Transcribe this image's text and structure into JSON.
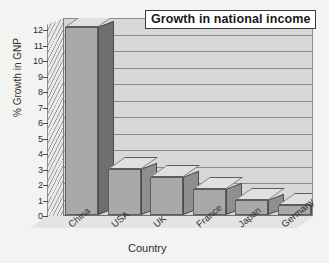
{
  "chart_data": {
    "type": "bar",
    "title": "Growth in national income",
    "xlabel": "Country",
    "ylabel": "% Growth in GNP",
    "categories": [
      "China",
      "USA",
      "UK",
      "France",
      "Japan",
      "Germany"
    ],
    "values": [
      11.4,
      2.8,
      2.3,
      1.6,
      0.9,
      0.6
    ],
    "ylim": [
      0,
      12
    ],
    "ytick_labels": [
      "0",
      "1",
      "2",
      "3",
      "4",
      "5",
      "6",
      "7",
      "8",
      "9",
      "10",
      "11",
      "12"
    ],
    "ytick_values": [
      0,
      1,
      2,
      3,
      4,
      5,
      6,
      7,
      8,
      9,
      10,
      11,
      12
    ],
    "grid": true,
    "legend": "none",
    "style": "3d-bar",
    "colors": {
      "bar_front": "#a9a9a9",
      "bar_side": "#6f6f6f",
      "bar_top": "#e0e0de",
      "plot_background": "#d7d7d5",
      "gridline": "#8b8b8b",
      "page_background": "#f3f3f2",
      "title_text": "#1a1a1a",
      "axis_text": "#2f2f2f"
    }
  }
}
